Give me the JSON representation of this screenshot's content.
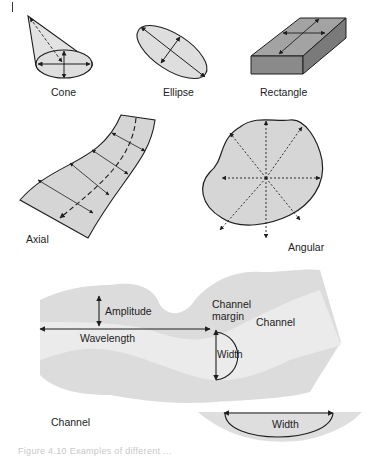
{
  "figure": {
    "panels": [
      {
        "id": "cone",
        "label": "Cone"
      },
      {
        "id": "ellipse",
        "label": "Ellipse"
      },
      {
        "id": "rectangle",
        "label": "Rectangle"
      },
      {
        "id": "axial",
        "label": "Axial"
      },
      {
        "id": "angular",
        "label": "Angular"
      }
    ],
    "channel_diagram": {
      "labels": {
        "amplitude": "Amplitude",
        "wavelength": "Wavelength",
        "channel_margin_line1": "Channel",
        "channel_margin_line2": "margin",
        "channel_right": "Channel",
        "width_plan": "Width",
        "channel_cross_section": "Channel",
        "width_section": "Width"
      }
    },
    "caption": "Figure 4.10   Examples of different ..."
  },
  "colors": {
    "fill_light": "#d9d9d9",
    "fill_channel_margin": "#dcdcdc",
    "fill_channel": "#ebebeb",
    "fill_box_top": "#9a9a9a",
    "fill_box_side": "#7e7e7e",
    "stroke": "#1e1e1e"
  }
}
